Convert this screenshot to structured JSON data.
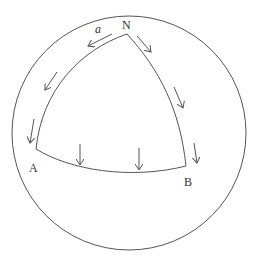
{
  "diagram": {
    "colors": {
      "stroke": "#555555",
      "text": "#333333",
      "background": "#ffffff"
    },
    "sphere": {
      "cx": 129,
      "cy": 133,
      "r": 117
    },
    "vertices": {
      "N": {
        "label": "N",
        "x": 127,
        "y": 34,
        "label_x": 122,
        "label_y": 29
      },
      "A": {
        "label": "A",
        "x": 36,
        "y": 149,
        "label_x": 29,
        "label_y": 172
      },
      "B": {
        "label": "B",
        "x": 186,
        "y": 166,
        "label_x": 184,
        "label_y": 186
      }
    },
    "vector_label": {
      "text": "a",
      "x": 95,
      "y": 33
    },
    "edges": [
      {
        "name": "edge-N-A",
        "d": "M127,34 C80,50 42,90 36,149"
      },
      {
        "name": "edge-N-B",
        "d": "M127,34 C160,70 180,110 186,166"
      },
      {
        "name": "edge-A-B",
        "d": "M36,149 C70,170 130,180 186,166"
      }
    ],
    "arrows": [
      {
        "x1": 112,
        "y1": 34,
        "x2": 88,
        "y2": 46
      },
      {
        "x1": 57,
        "y1": 72,
        "x2": 45,
        "y2": 90
      },
      {
        "x1": 34,
        "y1": 119,
        "x2": 30,
        "y2": 143
      },
      {
        "x1": 80,
        "y1": 144,
        "x2": 80,
        "y2": 165
      },
      {
        "x1": 139,
        "y1": 148,
        "x2": 139,
        "y2": 170
      },
      {
        "x1": 137,
        "y1": 36,
        "x2": 151,
        "y2": 52
      },
      {
        "x1": 174,
        "y1": 87,
        "x2": 183,
        "y2": 108
      },
      {
        "x1": 194,
        "y1": 143,
        "x2": 197,
        "y2": 163
      }
    ]
  }
}
